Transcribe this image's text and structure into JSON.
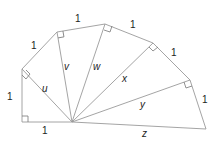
{
  "diagram": {
    "colors": {
      "line": "#9a9a9a",
      "text": "#222222",
      "background": "#ffffff"
    },
    "points": {
      "O": [
        72,
        122
      ],
      "A": [
        22,
        122
      ],
      "B": [
        22,
        69
      ],
      "C": [
        57,
        32
      ],
      "D": [
        105,
        24
      ],
      "E": [
        153,
        43
      ],
      "F": [
        190,
        80
      ],
      "G": [
        206,
        129
      ]
    },
    "unit_labels": [
      "1",
      "1",
      "1",
      "1",
      "1",
      "1",
      "1"
    ],
    "hypotenuse_labels": {
      "u": "u",
      "v": "v",
      "w": "w",
      "x": "x",
      "y": "y",
      "z": "z"
    }
  }
}
